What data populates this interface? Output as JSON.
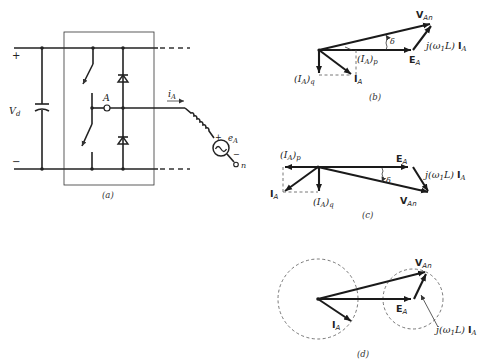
{
  "figure": {
    "panels": [
      {
        "id": "a",
        "caption": "(a)",
        "type": "circuit",
        "labels": {
          "dc_voltage": "V",
          "dc_voltage_sub": "d",
          "plus": "+",
          "minus": "−",
          "node": "A",
          "current": "i",
          "current_sub": "A",
          "source": "e",
          "source_sub": "A",
          "source_plus": "+",
          "source_minus": "−",
          "neutral": "n"
        }
      },
      {
        "id": "b",
        "caption": "(b)",
        "type": "phasor",
        "labels": {
          "v_an": "V",
          "v_an_sub": "An",
          "e_a": "E",
          "e_a_sub": "A",
          "i_a": "I",
          "i_a_sub": "A",
          "i_ap": "(I",
          "i_ap_sub": "A",
          "i_ap_close": ")",
          "i_ap_sub2": "p",
          "i_aq": "(I",
          "i_aq_sub": "A",
          "i_aq_close": ")",
          "i_aq_sub2": "q",
          "drop_pre": "j(ω",
          "drop_sub1": "1",
          "drop_mid": "L) ",
          "drop_bold": "I",
          "drop_sub2": "A",
          "delta": "δ"
        }
      },
      {
        "id": "c",
        "caption": "(c)",
        "type": "phasor",
        "labels": {
          "v_an": "V",
          "v_an_sub": "An",
          "e_a": "E",
          "e_a_sub": "A",
          "i_a": "I",
          "i_a_sub": "A",
          "i_ap": "(I",
          "i_ap_sub": "A",
          "i_ap_close": ")",
          "i_ap_sub2": "p",
          "i_aq": "(I",
          "i_aq_sub": "A",
          "i_aq_close": ")",
          "i_aq_sub2": "q",
          "drop_pre": "j(ω",
          "drop_sub1": "1",
          "drop_mid": "L) ",
          "drop_bold": "I",
          "drop_sub2": "A",
          "delta": "δ"
        }
      },
      {
        "id": "d",
        "caption": "(d)",
        "type": "phasor",
        "labels": {
          "v_an": "V",
          "v_an_sub": "An",
          "e_a": "E",
          "e_a_sub": "A",
          "i_a": "I",
          "i_a_sub": "A",
          "drop_pre": "j(ω",
          "drop_sub1": "1",
          "drop_mid": "L) ",
          "drop_bold": "I",
          "drop_sub2": "A"
        }
      }
    ]
  }
}
